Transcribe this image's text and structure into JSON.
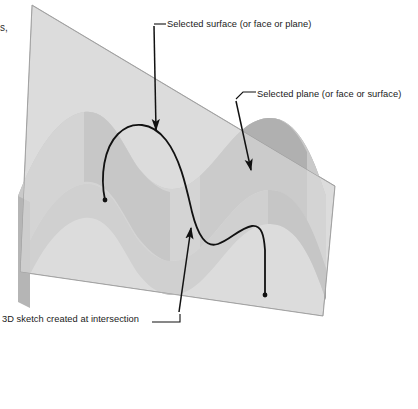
{
  "figure": {
    "kind": "technical-illustration",
    "background_color": "#ffffff"
  },
  "edge_fragment": {
    "text": "s,"
  },
  "labels": {
    "surface": {
      "text": "Selected surface (or face or plane)",
      "leader": "straight-arrow-down"
    },
    "plane": {
      "text": "Selected plane (or face or surface)",
      "leader": "elbow-arrow-down-left"
    },
    "sketch": {
      "text": "3D sketch created at intersection",
      "leader": "elbow-arrow-up-right"
    }
  },
  "geometry": {
    "plane": {
      "name": "selected-plane",
      "fill": "#dcdcdc",
      "stroke": "#9a9a9a",
      "corners": [
        [
          32,
          5
        ],
        [
          335,
          186
        ],
        [
          323,
          316
        ],
        [
          20,
          272
        ]
      ]
    },
    "surface": {
      "name": "corrugated-surface",
      "fill_light": "#cccccc",
      "fill_mid": "#b3b3b3",
      "fill_dark": "#9e9e9e"
    },
    "curve": {
      "name": "intersection-curve",
      "stroke": "#111111",
      "stroke_width": 1.7,
      "endpoint_left": [
        105,
        200
      ],
      "endpoint_right": [
        265,
        296
      ]
    }
  },
  "colors": {
    "plane_fill": "#dcdcdc",
    "surface_light": "#cccccc",
    "surface_mid": "#b3b3b3",
    "surface_dark": "#9e9e9e",
    "line": "#111111",
    "text": "#1a1a1a"
  }
}
